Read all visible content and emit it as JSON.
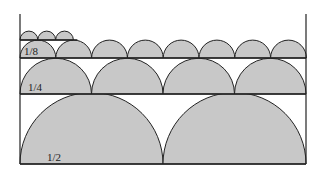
{
  "diagram": {
    "fill_color": "#c8c8c8",
    "stroke_color": "#222222",
    "rows": [
      {
        "label": "1/2",
        "count": 2,
        "baseline_y": 164,
        "radius": 71.5
      },
      {
        "label": "1/4",
        "count": 4,
        "baseline_y": 94,
        "radius": 35.75
      },
      {
        "label": "1/8",
        "count": 8,
        "baseline_y": 58,
        "radius": 17.9
      },
      {
        "label": "",
        "count": 3,
        "baseline_y": 40,
        "radius": 8.9
      }
    ]
  }
}
